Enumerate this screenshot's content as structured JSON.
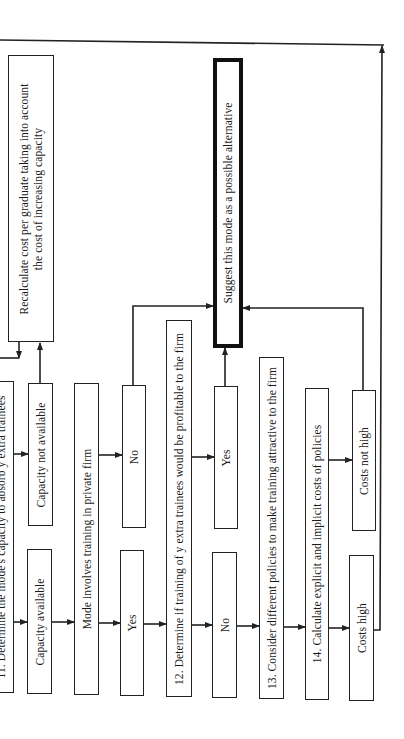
{
  "flowchart": {
    "orientation": "rotated 90 degrees counter-clockwise",
    "steps": {
      "step11": "11. Determine the mode's capacity to absorb y extra trainees",
      "capacity_available": "Capacity available",
      "capacity_not_available": "Capacity not available",
      "recalculate_line1": "Recalculate cost per graduate taking into account",
      "recalculate_line2": "the cost of increasing capacity",
      "mode_private_firm": "Mode involves training in private firm",
      "yes_1": "Yes",
      "no_1": "No",
      "step12": "12. Determine if training of y extra trainees would be profitable to the firm",
      "no_2": "No",
      "yes_2": "Yes",
      "suggest": "Suggest this mode as a possible alternative",
      "step13": "13. Consider different policies to make training attractive to the firm",
      "step14": "14. Calculate explicit and implicit costs of policies",
      "costs_high": "Costs high",
      "costs_not_high": "Costs not high"
    },
    "colors": {
      "line": "#222222",
      "background": "#ffffff"
    }
  }
}
